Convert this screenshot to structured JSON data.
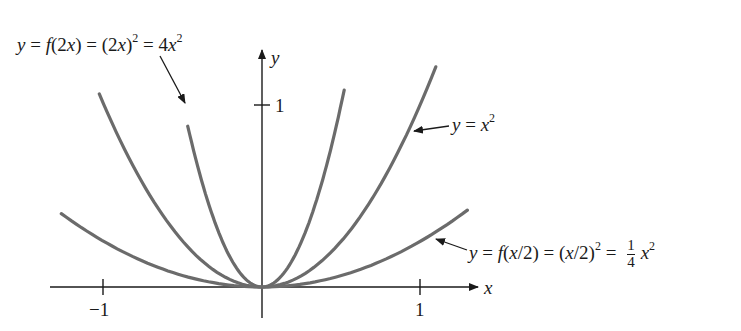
{
  "chart_data": {
    "type": "line",
    "title": "",
    "xlabel": "x",
    "ylabel": "y",
    "x_ticks": [
      "-1",
      "1"
    ],
    "y_ticks": [
      "1"
    ],
    "grid": false,
    "series": [
      {
        "name": "y = f(2x) = (2x)^2 = 4x^2",
        "formula": "4x^2",
        "x_range": [
          -0.47,
          0.52
        ]
      },
      {
        "name": "y = x^2",
        "formula": "x^2",
        "x_range": [
          -1.03,
          1.1
        ]
      },
      {
        "name": "y = f(x/2) = (x/2)^2 = 1/4 x^2",
        "formula": "0.25x^2",
        "x_range": [
          -1.27,
          1.3
        ]
      }
    ],
    "colors": {
      "curve": "#6b6b6b",
      "axis": "#1a1a1a"
    }
  },
  "labels": {
    "axis_x": "x",
    "axis_y": "y",
    "tick_x_neg1": "−1",
    "tick_x_pos1": "1",
    "tick_y_1": "1",
    "top": {
      "y": "y",
      "eq1": "=",
      "f": "f",
      "arg1": "(2",
      "x1": "x",
      "p1": ")",
      "eq2": "=",
      "open": "(2",
      "x2": "x",
      "close": ")",
      "exp1": "2",
      "eq3": "=",
      "coef": "4",
      "x3": "x",
      "exp2": "2"
    },
    "mid": {
      "y": "y",
      "eq": "=",
      "x": "x",
      "exp": "2"
    },
    "bottom": {
      "y": "y",
      "eq1": "=",
      "f": "f",
      "open1": "(",
      "x1": "x",
      "rest1": "/2)",
      "eq2": "=",
      "open2": "(",
      "x2": "x",
      "rest2": "/2)",
      "exp1": "2",
      "eq3": "=",
      "num": "1",
      "den": "4",
      "x3": "x",
      "exp2": "2"
    }
  }
}
